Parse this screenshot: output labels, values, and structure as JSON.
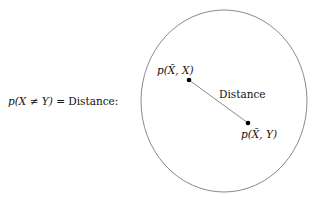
{
  "equation": {
    "lhs": "p(X ≠ Y)",
    "eq": " = ",
    "rhs": "Distance:"
  },
  "points": [
    {
      "label": "p(X̃, X)",
      "x": 189,
      "y": 80
    },
    {
      "label": "p(X̃, Y)",
      "x": 248,
      "y": 123
    }
  ],
  "segment_label": "Distance",
  "circle": {
    "cx": 224,
    "cy": 101,
    "rx": 83,
    "ry": 91,
    "stroke": "#888888"
  },
  "line_color": "#888888",
  "point_color": "#000000"
}
